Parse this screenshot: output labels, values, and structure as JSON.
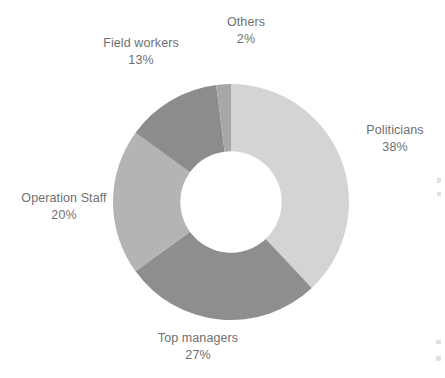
{
  "chart_data": {
    "type": "pie",
    "variant": "donut",
    "title": "",
    "subtitle": "",
    "xlabel": "",
    "ylabel": "",
    "legend_position": "none",
    "labels_position": "outside",
    "grid": false,
    "units": "percent",
    "total": 100,
    "categories": [
      "Politicians",
      "Top managers",
      "Operation Staff",
      "Field workers",
      "Others"
    ],
    "values": [
      38,
      27,
      20,
      13,
      2
    ],
    "value_labels": [
      "38%",
      "27%",
      "20%",
      "13%",
      "2%"
    ],
    "colors": [
      "#d4d4d4",
      "#8e8e8e",
      "#b4b4b4",
      "#8c8c8c",
      "#a8a8a8"
    ],
    "start_angle_deg": 0,
    "direction": "clockwise",
    "inner_radius_ratio": 0.43,
    "slices": [
      {
        "name": "Politicians",
        "value": 38,
        "value_label": "38%",
        "color": "#d4d4d4"
      },
      {
        "name": "Top managers",
        "value": 27,
        "value_label": "27%",
        "color": "#8e8e8e"
      },
      {
        "name": "Operation Staff",
        "value": 20,
        "value_label": "20%",
        "color": "#b4b4b4"
      },
      {
        "name": "Field workers",
        "value": 13,
        "value_label": "13%",
        "color": "#8c8c8c"
      },
      {
        "name": "Others",
        "value": 2,
        "value_label": "2%",
        "color": "#a8a8a8"
      }
    ]
  },
  "labels": {
    "others": {
      "name": "Others",
      "value": "2%"
    },
    "field": {
      "name": "Field workers",
      "value": "13%"
    },
    "politicians": {
      "name": "Politicians",
      "value": "38%"
    },
    "operation": {
      "name": "Operation Staff",
      "value": "20%"
    },
    "top": {
      "name": "Top managers",
      "value": "27%"
    }
  },
  "background_color": "#ffffff",
  "text_color": "#6f6f6f"
}
